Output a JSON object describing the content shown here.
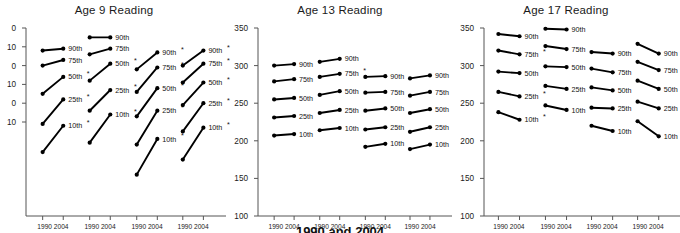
{
  "footer": {
    "caption": "1990 and 2004"
  },
  "common": {
    "x_groups": [
      "All Students",
      "White",
      "Black",
      "Hispanic"
    ],
    "year_labels": [
      "1990",
      "2004"
    ],
    "percentiles": [
      "90th",
      "75th",
      "50th",
      "25th",
      "10th"
    ],
    "significance_marker": "*",
    "line_color": "#000000",
    "axis_color": "#555555"
  },
  "chart_data": [
    {
      "type": "line",
      "title": "Age 9 Reading",
      "xlabel": "",
      "ylabel": "",
      "ylim": [
        150,
        250
      ],
      "yticks": [
        250,
        240,
        230,
        220,
        210,
        200
      ],
      "ytick_labels": [
        "0",
        "10",
        "0",
        "10",
        "0",
        "10"
      ],
      "ytick_note": "leading digits cropped at image left edge",
      "grid": false,
      "x": [
        "1990",
        "2004"
      ],
      "categories": [
        "All Students",
        "White",
        "Black",
        "Hispanic"
      ],
      "groups": [
        {
          "name": "All Students",
          "series": [
            {
              "name": "90th",
              "values": [
                238,
                239
              ],
              "sig": false
            },
            {
              "name": "75th",
              "values": [
                230,
                233
              ],
              "sig": false
            },
            {
              "name": "50th",
              "values": [
                215,
                224
              ],
              "sig": true
            },
            {
              "name": "25th",
              "values": [
                199,
                212
              ],
              "sig": true
            },
            {
              "name": "10th",
              "values": [
                184,
                198
              ],
              "sig": true
            }
          ]
        },
        {
          "name": "White",
          "series": [
            {
              "name": "90th",
              "values": [
                245,
                245
              ],
              "sig": false
            },
            {
              "name": "75th",
              "values": [
                236,
                239
              ],
              "sig": false
            },
            {
              "name": "50th",
              "values": [
                222,
                231
              ],
              "sig": true
            },
            {
              "name": "25th",
              "values": [
                206,
                217
              ],
              "sig": true
            },
            {
              "name": "10th",
              "values": [
                189,
                204
              ],
              "sig": true
            }
          ]
        },
        {
          "name": "Black",
          "series": [
            {
              "name": "90th",
              "values": [
                228,
                237
              ],
              "sig": true
            },
            {
              "name": "75th",
              "values": [
                216,
                229
              ],
              "sig": true
            },
            {
              "name": "50th",
              "values": [
                203,
                218
              ],
              "sig": true
            },
            {
              "name": "25th",
              "values": [
                188,
                206
              ],
              "sig": true
            },
            {
              "name": "10th",
              "values": [
                172,
                191
              ],
              "sig": true
            }
          ]
        },
        {
          "name": "Hispanic",
          "series": [
            {
              "name": "90th",
              "values": [
                230,
                238
              ],
              "sig": true
            },
            {
              "name": "75th",
              "values": [
                221,
                231
              ],
              "sig": true
            },
            {
              "name": "50th",
              "values": [
                209,
                221
              ],
              "sig": true
            },
            {
              "name": "25th",
              "values": [
                195,
                210
              ],
              "sig": true
            },
            {
              "name": "10th",
              "values": [
                180,
                197
              ],
              "sig": true
            }
          ]
        }
      ]
    },
    {
      "type": "line",
      "title": "Age 13 Reading",
      "xlabel": "",
      "ylabel": "",
      "ylim": [
        100,
        350
      ],
      "yticks": [
        350,
        300,
        250,
        200,
        150,
        100
      ],
      "ytick_labels": [
        "350",
        "300",
        "250",
        "200",
        "150",
        "100"
      ],
      "grid": false,
      "x": [
        "1990",
        "2004"
      ],
      "categories": [
        "All Students",
        "White",
        "Black",
        "Hispanic"
      ],
      "groups": [
        {
          "name": "All Students",
          "series": [
            {
              "name": "90th",
              "values": [
                300,
                302
              ],
              "sig": false
            },
            {
              "name": "75th",
              "values": [
                279,
                282
              ],
              "sig": false
            },
            {
              "name": "50th",
              "values": [
                255,
                257
              ],
              "sig": false
            },
            {
              "name": "25th",
              "values": [
                231,
                233
              ],
              "sig": false
            },
            {
              "name": "10th",
              "values": [
                207,
                209
              ],
              "sig": false
            }
          ]
        },
        {
          "name": "White",
          "series": [
            {
              "name": "90th",
              "values": [
                305,
                309
              ],
              "sig": false
            },
            {
              "name": "75th",
              "values": [
                285,
                289
              ],
              "sig": true
            },
            {
              "name": "50th",
              "values": [
                261,
                266
              ],
              "sig": false
            },
            {
              "name": "25th",
              "values": [
                237,
                241
              ],
              "sig": false
            },
            {
              "name": "10th",
              "values": [
                214,
                217
              ],
              "sig": false
            }
          ]
        },
        {
          "name": "Black",
          "series": [
            {
              "name": "90th",
              "values": [
                285,
                286
              ],
              "sig": false
            },
            {
              "name": "75th",
              "values": [
                264,
                265
              ],
              "sig": false
            },
            {
              "name": "50th",
              "values": [
                240,
                243
              ],
              "sig": false
            },
            {
              "name": "25th",
              "values": [
                215,
                218
              ],
              "sig": false
            },
            {
              "name": "10th",
              "values": [
                192,
                196
              ],
              "sig": false
            }
          ]
        },
        {
          "name": "Hispanic",
          "series": [
            {
              "name": "90th",
              "values": [
                283,
                287
              ],
              "sig": false
            },
            {
              "name": "75th",
              "values": [
                260,
                265
              ],
              "sig": false
            },
            {
              "name": "50th",
              "values": [
                237,
                242
              ],
              "sig": false
            },
            {
              "name": "25th",
              "values": [
                212,
                218
              ],
              "sig": false
            },
            {
              "name": "10th",
              "values": [
                189,
                195
              ],
              "sig": false
            }
          ]
        }
      ]
    },
    {
      "type": "line",
      "title": "Age 17 Reading",
      "xlabel": "",
      "ylabel": "",
      "ylim": [
        100,
        350
      ],
      "yticks": [
        350,
        300,
        250,
        200,
        150,
        100
      ],
      "ytick_labels": [
        "350",
        "300",
        "250",
        "200",
        "150",
        "100"
      ],
      "grid": false,
      "x": [
        "1990",
        "2004"
      ],
      "categories": [
        "All Students",
        "White",
        "Black",
        "Hispanic"
      ],
      "groups": [
        {
          "name": "All Students",
          "series": [
            {
              "name": "90th",
              "values": [
                342,
                339
              ],
              "sig": false
            },
            {
              "name": "75th",
              "values": [
                320,
                315
              ],
              "sig": true
            },
            {
              "name": "50th",
              "values": [
                292,
                290
              ],
              "sig": false
            },
            {
              "name": "25th",
              "values": [
                265,
                259
              ],
              "sig": true
            },
            {
              "name": "10th",
              "values": [
                238,
                228
              ],
              "sig": true
            }
          ]
        },
        {
          "name": "White",
          "series": [
            {
              "name": "90th",
              "values": [
                349,
                348
              ],
              "sig": false
            },
            {
              "name": "75th",
              "values": [
                326,
                322
              ],
              "sig": false
            },
            {
              "name": "50th",
              "values": [
                299,
                298
              ],
              "sig": false
            },
            {
              "name": "25th",
              "values": [
                273,
                269
              ],
              "sig": false
            },
            {
              "name": "10th",
              "values": [
                247,
                241
              ],
              "sig": false
            }
          ]
        },
        {
          "name": "Black",
          "series": [
            {
              "name": "90th",
              "values": [
                318,
                316
              ],
              "sig": false
            },
            {
              "name": "75th",
              "values": [
                296,
                291
              ],
              "sig": false
            },
            {
              "name": "50th",
              "values": [
                271,
                267
              ],
              "sig": false
            },
            {
              "name": "25th",
              "values": [
                244,
                243
              ],
              "sig": false
            },
            {
              "name": "10th",
              "values": [
                220,
                213
              ],
              "sig": false
            }
          ]
        },
        {
          "name": "Hispanic",
          "series": [
            {
              "name": "90th",
              "values": [
                329,
                316
              ],
              "sig": false
            },
            {
              "name": "75th",
              "values": [
                305,
                294
              ],
              "sig": false
            },
            {
              "name": "50th",
              "values": [
                280,
                269
              ],
              "sig": false
            },
            {
              "name": "25th",
              "values": [
                252,
                243
              ],
              "sig": false
            },
            {
              "name": "10th",
              "values": [
                226,
                206
              ],
              "sig": false
            }
          ]
        }
      ]
    }
  ]
}
